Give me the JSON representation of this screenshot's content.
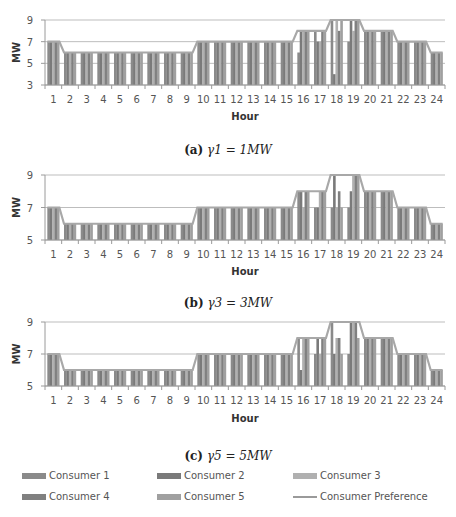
{
  "chart_data": [
    {
      "type": "bar",
      "title": "(a) γ1 = 1MW",
      "caption_label": "(a)",
      "caption_math": "γ1 = 1MW",
      "xlabel": "Hour",
      "ylabel": "MW",
      "ylim": [
        3,
        9
      ],
      "yticks": [
        3,
        5,
        7,
        9
      ],
      "grid": true,
      "categories": [
        "1",
        "2",
        "3",
        "4",
        "5",
        "6",
        "7",
        "8",
        "9",
        "10",
        "11",
        "12",
        "13",
        "14",
        "15",
        "16",
        "17",
        "18",
        "19",
        "20",
        "21",
        "22",
        "23",
        "24"
      ],
      "series": [
        {
          "name": "Consumer 1",
          "values": [
            7,
            6,
            6,
            6,
            6,
            6,
            6,
            6,
            6,
            7,
            7,
            7,
            7,
            7,
            7,
            6,
            8,
            9,
            7,
            8,
            8,
            7,
            7,
            6
          ]
        },
        {
          "name": "Consumer 2",
          "values": [
            7,
            6,
            6,
            6,
            6,
            6,
            6,
            6,
            6,
            7,
            7,
            7,
            7,
            7,
            7,
            8,
            7,
            4,
            9,
            8,
            8,
            7,
            7,
            6
          ]
        },
        {
          "name": "Consumer 3",
          "values": [
            7,
            6,
            6,
            6,
            6,
            6,
            6,
            6,
            6,
            7,
            7,
            7,
            7,
            7,
            7,
            8,
            7,
            9,
            8,
            8,
            8,
            7,
            7,
            6
          ]
        },
        {
          "name": "Consumer 4",
          "values": [
            7,
            6,
            6,
            6,
            6,
            6,
            6,
            6,
            6,
            7,
            7,
            7,
            7,
            7,
            7,
            8,
            8,
            8,
            9,
            8,
            8,
            7,
            7,
            6
          ]
        },
        {
          "name": "Consumer 5",
          "values": [
            7,
            6,
            6,
            6,
            6,
            6,
            6,
            6,
            6,
            7,
            7,
            7,
            7,
            7,
            7,
            8,
            8,
            9,
            9,
            8,
            8,
            7,
            7,
            6
          ]
        },
        {
          "name": "Consumer Preference",
          "type": "line",
          "values": [
            7,
            6,
            6,
            6,
            6,
            6,
            6,
            6,
            6,
            7,
            7,
            7,
            7,
            7,
            7,
            8,
            8,
            9,
            9,
            8,
            8,
            7,
            7,
            6
          ]
        }
      ]
    },
    {
      "type": "bar",
      "title": "(b) γ3 = 3MW",
      "caption_label": "(b)",
      "caption_math": "γ3 = 3MW",
      "xlabel": "Hour",
      "ylabel": "MW",
      "ylim": [
        5,
        9
      ],
      "yticks": [
        5,
        7,
        9
      ],
      "grid": true,
      "categories": [
        "1",
        "2",
        "3",
        "4",
        "5",
        "6",
        "7",
        "8",
        "9",
        "10",
        "11",
        "12",
        "13",
        "14",
        "15",
        "16",
        "17",
        "18",
        "19",
        "20",
        "21",
        "22",
        "23",
        "24"
      ],
      "series": [
        {
          "name": "Consumer 1",
          "values": [
            7,
            6,
            6,
            6,
            6,
            6,
            6,
            6,
            6,
            7,
            7,
            7,
            7,
            7,
            7,
            8,
            7,
            7,
            7,
            8,
            8,
            7,
            7,
            6
          ]
        },
        {
          "name": "Consumer 2",
          "values": [
            7,
            6,
            6,
            6,
            6,
            6,
            6,
            6,
            6,
            7,
            7,
            7,
            7,
            7,
            7,
            8,
            7,
            9,
            8,
            8,
            8,
            7,
            7,
            6
          ]
        },
        {
          "name": "Consumer 3",
          "values": [
            7,
            6,
            6,
            6,
            6,
            6,
            6,
            6,
            6,
            7,
            7,
            7,
            7,
            7,
            7,
            7,
            8,
            7,
            9,
            8,
            8,
            7,
            7,
            6
          ]
        },
        {
          "name": "Consumer 4",
          "values": [
            7,
            6,
            6,
            6,
            6,
            6,
            6,
            6,
            6,
            7,
            7,
            7,
            7,
            7,
            7,
            8,
            8,
            8,
            9,
            8,
            8,
            7,
            7,
            6
          ]
        },
        {
          "name": "Consumer 5",
          "values": [
            7,
            6,
            6,
            6,
            6,
            6,
            6,
            6,
            6,
            7,
            7,
            7,
            7,
            7,
            7,
            8,
            8,
            7,
            9,
            8,
            8,
            7,
            7,
            6
          ]
        },
        {
          "name": "Consumer Preference",
          "type": "line",
          "values": [
            7,
            6,
            6,
            6,
            6,
            6,
            6,
            6,
            6,
            7,
            7,
            7,
            7,
            7,
            7,
            8,
            8,
            9,
            9,
            8,
            8,
            7,
            7,
            6
          ]
        }
      ]
    },
    {
      "type": "bar",
      "title": "(c) γ5 = 5MW",
      "caption_label": "(c)",
      "caption_math": "γ5 = 5MW",
      "xlabel": "Hour",
      "ylabel": "MW",
      "ylim": [
        5,
        9
      ],
      "yticks": [
        5,
        7,
        9
      ],
      "grid": true,
      "categories": [
        "1",
        "2",
        "3",
        "4",
        "5",
        "6",
        "7",
        "8",
        "9",
        "10",
        "11",
        "12",
        "13",
        "14",
        "15",
        "16",
        "17",
        "18",
        "19",
        "20",
        "21",
        "22",
        "23",
        "24"
      ],
      "series": [
        {
          "name": "Consumer 1",
          "values": [
            7,
            6,
            6,
            6,
            6,
            6,
            6,
            6,
            6,
            7,
            7,
            7,
            7,
            7,
            7,
            8,
            7,
            9,
            7,
            8,
            8,
            7,
            7,
            6
          ]
        },
        {
          "name": "Consumer 2",
          "values": [
            7,
            6,
            6,
            6,
            6,
            6,
            6,
            6,
            6,
            7,
            7,
            7,
            7,
            7,
            7,
            6,
            8,
            7,
            9,
            8,
            8,
            7,
            7,
            6
          ]
        },
        {
          "name": "Consumer 3",
          "values": [
            7,
            6,
            6,
            6,
            6,
            6,
            6,
            6,
            6,
            7,
            7,
            7,
            7,
            7,
            7,
            8,
            7,
            8,
            9,
            8,
            8,
            7,
            7,
            6
          ]
        },
        {
          "name": "Consumer 4",
          "values": [
            7,
            6,
            6,
            6,
            6,
            6,
            6,
            6,
            6,
            7,
            7,
            7,
            7,
            7,
            7,
            8,
            8,
            8,
            9,
            8,
            8,
            7,
            7,
            6
          ]
        },
        {
          "name": "Consumer 5",
          "values": [
            7,
            6,
            6,
            6,
            6,
            6,
            6,
            6,
            6,
            7,
            7,
            7,
            7,
            7,
            7,
            8,
            8,
            7,
            8,
            8,
            8,
            7,
            7,
            6
          ]
        },
        {
          "name": "Consumer Preference",
          "type": "line",
          "values": [
            7,
            6,
            6,
            6,
            6,
            6,
            6,
            6,
            6,
            7,
            7,
            7,
            7,
            7,
            7,
            8,
            8,
            9,
            9,
            8,
            8,
            7,
            7,
            6
          ]
        }
      ]
    }
  ],
  "legend": {
    "position": "bottom",
    "items": [
      {
        "label": "Consumer 1",
        "color": "#8a8a8a",
        "kind": "bar"
      },
      {
        "label": "Consumer 2",
        "color": "#7a7a7a",
        "kind": "bar"
      },
      {
        "label": "Consumer 3",
        "color": "#b0b0b0",
        "kind": "bar"
      },
      {
        "label": "Consumer 4",
        "color": "#808080",
        "kind": "bar"
      },
      {
        "label": "Consumer 5",
        "color": "#a0a0a0",
        "kind": "bar"
      },
      {
        "label": "Consumer Preference",
        "color": "#9a9a9a",
        "kind": "line"
      }
    ]
  },
  "colors": {
    "bars": [
      "#8a8a8a",
      "#7a7a7a",
      "#b0b0b0",
      "#808080",
      "#a0a0a0"
    ],
    "line": "#a8a8a8",
    "grid": "#bdbdbd",
    "axis": "#9a9a9a",
    "tick_text": "#555555"
  }
}
